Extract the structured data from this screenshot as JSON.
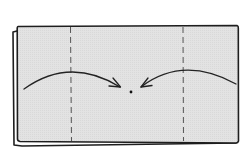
{
  "diagram": {
    "kind": "origami-fold-step",
    "colors": {
      "paper": "#e2e2e2",
      "outline": "#1e1e1e",
      "dashed": "#555555",
      "arrow": "#222222",
      "background": "#ffffff"
    },
    "paper": {
      "x": 17,
      "y": 26,
      "width": 221,
      "height": 117
    },
    "back_layer_offset": {
      "dx": -4,
      "dy": 5
    },
    "fold_lines": [
      {
        "id": "left-fold",
        "x": 71,
        "style": "dashed"
      },
      {
        "id": "right-fold",
        "x": 183,
        "style": "dashed"
      }
    ],
    "arrows": [
      {
        "id": "left-arrow",
        "from": [
          24,
          89
        ],
        "via": [
          70,
          60
        ],
        "to": [
          120,
          87
        ]
      },
      {
        "id": "right-arrow",
        "from": [
          236,
          84
        ],
        "via": [
          183,
          58
        ],
        "to": [
          141,
          87
        ]
      }
    ],
    "center_point": {
      "x": 131,
      "y": 92
    },
    "alt_text": "Fold both sides in to the center"
  }
}
